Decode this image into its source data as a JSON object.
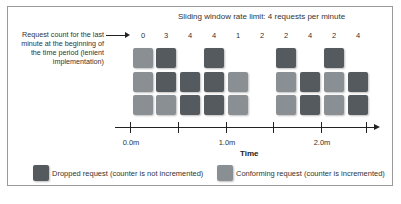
{
  "title": "Sliding window rate limit: 4 requests per minute",
  "lead_label": "Request count for the last minute at the beginning of the time period (lenient implementation)",
  "colors": {
    "dropped": "#555a5f",
    "conforming": "#8a8f93",
    "axis": "#222222"
  },
  "columns": [
    {
      "count": "0",
      "x": 133,
      "boxes": [
        "",
        "conforming",
        "conforming",
        "conforming"
      ]
    },
    {
      "count": "3",
      "x": 156,
      "boxes": [
        "",
        "dropped",
        "dropped",
        "conforming"
      ]
    },
    {
      "count": "4",
      "x": 180,
      "boxes": [
        "",
        "",
        "dropped",
        "dropped"
      ]
    },
    {
      "count": "4",
      "x": 204,
      "boxes": [
        "",
        "dropped",
        "dropped",
        "dropped"
      ]
    },
    {
      "count": "1",
      "x": 228,
      "boxes": [
        "",
        "",
        "conforming",
        "conforming"
      ]
    },
    {
      "count": "2",
      "x": 252,
      "boxes": [
        "",
        "",
        "",
        ""
      ]
    },
    {
      "count": "2",
      "x": 276,
      "boxes": [
        "",
        "dropped",
        "conforming",
        "conforming"
      ]
    },
    {
      "count": "4",
      "x": 300,
      "boxes": [
        "",
        "",
        "dropped",
        "dropped"
      ]
    },
    {
      "count": "2",
      "x": 324,
      "boxes": [
        "",
        "dropped",
        "conforming",
        "conforming"
      ]
    },
    {
      "count": "4",
      "x": 348,
      "boxes": [
        "",
        "",
        "dropped",
        "dropped"
      ]
    }
  ],
  "axis": {
    "label": "Time",
    "ticks": [
      {
        "x": 130,
        "label": "0.0m"
      },
      {
        "x": 178,
        "label": ""
      },
      {
        "x": 226,
        "label": "1.0m"
      },
      {
        "x": 273,
        "label": ""
      },
      {
        "x": 321,
        "label": "2.0m"
      },
      {
        "x": 366,
        "label": ""
      }
    ]
  },
  "legend": {
    "dropped": "Dropped request (counter is not incremented)",
    "conforming": "Conforming request (counter is incremented)"
  }
}
